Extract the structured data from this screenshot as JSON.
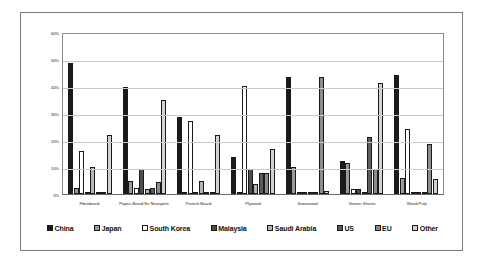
{
  "chart_data": {
    "type": "bar",
    "title": "",
    "subtitle": "",
    "xlabel": "",
    "ylabel": "",
    "ylim": [
      0,
      60
    ],
    "ytick_labels": [
      "0%",
      "10%",
      "20%",
      "30%",
      "40%",
      "50%",
      "60%"
    ],
    "ytick_values": [
      0,
      10,
      20,
      30,
      40,
      50,
      60
    ],
    "grid": true,
    "legend_position": "bottom",
    "categories": [
      "Fibreboard",
      "Paper+Board Ex Newsprint",
      "Particle Board",
      "Plywood",
      "Sawnwood",
      "Veneer Sheets",
      "Wood Pulp"
    ],
    "series": [
      {
        "name": "China",
        "color": "#1a1a1a",
        "values": [
          49.0,
          40.0,
          29.0,
          13.7,
          44.0,
          12.2,
          44.5
        ]
      },
      {
        "name": "Japan",
        "color": "#9a9a9a",
        "values": [
          2.2,
          4.8,
          0.6,
          0.2,
          10.0,
          11.7,
          6.1
        ]
      },
      {
        "name": "South Korea",
        "color": "#ffffff",
        "values": [
          16.0,
          2.2,
          27.2,
          40.5,
          0.3,
          1.7,
          24.3
        ]
      },
      {
        "name": "Malaysia",
        "color": "#4d4d4d",
        "values": [
          0.3,
          9.4,
          0.3,
          9.3,
          0.2,
          2.0,
          0.2
        ]
      },
      {
        "name": "Saudi Arabia",
        "color": "#b5b5b5",
        "values": [
          10.0,
          1.9,
          4.8,
          3.8,
          0.2,
          0.2,
          0.6
        ]
      },
      {
        "name": "US",
        "color": "#5c5c5c",
        "values": [
          0.8,
          2.2,
          0.2,
          7.7,
          0.6,
          21.2,
          0.5
        ]
      },
      {
        "name": "EU",
        "color": "#8c8c8c",
        "values": [
          0.3,
          4.6,
          0.3,
          8.0,
          44.0,
          9.4,
          18.9
        ]
      },
      {
        "name": "Other",
        "color": "#d2d2d2",
        "values": [
          22.1,
          35.1,
          22.1,
          17.0,
          1.2,
          41.5,
          5.5
        ]
      }
    ]
  }
}
